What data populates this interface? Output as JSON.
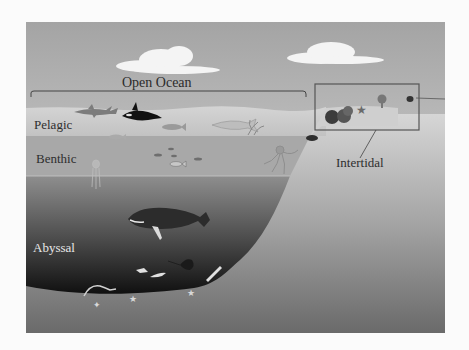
{
  "diagram": {
    "labels": {
      "open_ocean": "Open Ocean",
      "pelagic": "Pelagic",
      "benthic": "Benthic",
      "abyssal": "Abyssal",
      "intertidal": "Intertidal"
    },
    "zones": [
      {
        "name": "Pelagic",
        "region": "upper open water"
      },
      {
        "name": "Benthic",
        "region": "mid-depth open water"
      },
      {
        "name": "Abyssal",
        "region": "deep ocean floor"
      },
      {
        "name": "Intertidal",
        "region": "shoreline edge (boxed)"
      }
    ],
    "icons": [
      "cloud-icon",
      "shark-icon",
      "orca-icon",
      "fish-icon",
      "whale-icon",
      "jellyfish-icon",
      "octopus-icon",
      "ray-icon",
      "starfish-icon",
      "coral-icon",
      "eel-icon"
    ],
    "colors": {
      "sky_top": "#a9a9a9",
      "sky_bottom": "#e2e2e2",
      "pelagic": "#c9c9c9",
      "benthic": "#a6a6a6",
      "deep_top": "#8c8c8c",
      "abyss_bottom": "#151515",
      "land_top": "#d2d2d2",
      "land_bottom": "#6f6f6f",
      "outline": "#555555"
    }
  }
}
